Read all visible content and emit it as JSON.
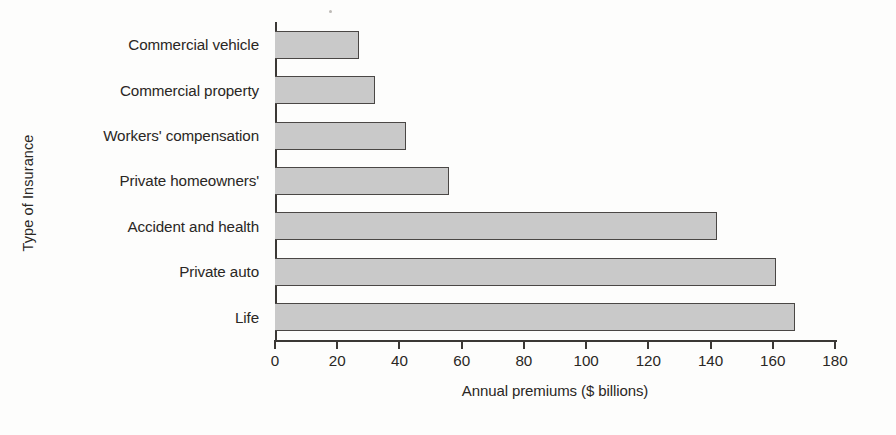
{
  "chart_data": {
    "type": "bar",
    "orientation": "horizontal",
    "title": "",
    "xlabel": "Annual premiums ($ billions)",
    "ylabel": "Type of Insurance",
    "categories": [
      "Commercial vehicle",
      "Commercial property",
      "Workers' compensation",
      "Private homeowners'",
      "Accident and health",
      "Private auto",
      "Life"
    ],
    "values": [
      27,
      32,
      42,
      56,
      142,
      161,
      167
    ],
    "xlim": [
      0,
      180
    ],
    "xticks": [
      0,
      20,
      40,
      60,
      80,
      100,
      120,
      140,
      160,
      180
    ],
    "xtick_labels": [
      "0",
      "20",
      "40",
      "60",
      "80",
      "100",
      "120",
      "140",
      "160",
      "180"
    ],
    "grid": false,
    "legend": null,
    "bar_fill_color": "#c9c9c9",
    "bar_edge_color": "#4a4745",
    "axis_color": "#3b3835",
    "background_color": "#fdfdfc"
  }
}
